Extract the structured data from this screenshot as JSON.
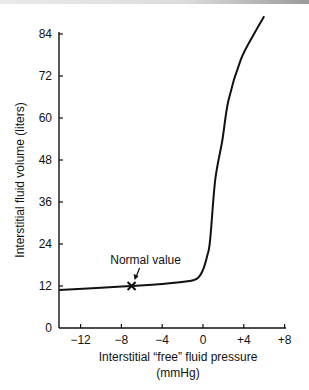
{
  "chart_data": {
    "type": "line",
    "title": "",
    "xlabel": "Interstitial “free” fluid pressure",
    "xlabel_unit": "(mmHg)",
    "ylabel": "Interstitial fluid volume (liters)",
    "xlim": [
      -14,
      8
    ],
    "ylim": [
      0,
      84
    ],
    "x_ticks": [
      -12,
      -8,
      -4,
      0,
      4,
      8
    ],
    "x_tick_labels": [
      "−12",
      "−8",
      "−4",
      "0",
      "+4",
      "+8"
    ],
    "y_ticks": [
      0,
      12,
      24,
      36,
      48,
      60,
      72,
      84
    ],
    "y_tick_labels": [
      "0",
      "12",
      "24",
      "36",
      "48",
      "60",
      "72",
      "84"
    ],
    "grid": false,
    "legend": null,
    "series": [
      {
        "name": "Interstitial fluid volume",
        "x": [
          -14.1,
          -10,
          -7.0,
          -4,
          -1.3,
          -0.5,
          0,
          0.4,
          0.7,
          1.2,
          1.9,
          2.5,
          3.7,
          5.0,
          6.0
        ],
        "y": [
          10.9,
          11.5,
          12.0,
          12.6,
          13.4,
          14.3,
          16.6,
          20.5,
          25.1,
          42.3,
          53.7,
          65.1,
          76.6,
          84.0,
          89.1
        ]
      }
    ],
    "annotations": [
      {
        "text": "Normal value",
        "x": -7.0,
        "y": 12.0,
        "marker": "x"
      }
    ]
  }
}
